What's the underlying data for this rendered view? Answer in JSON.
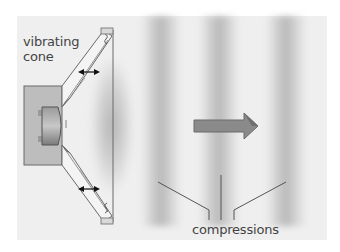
{
  "diagram": {
    "labels": {
      "cone": "vibrating\ncone",
      "cone_line1": "vibrating",
      "cone_line2": "cone",
      "compressions": "compressions"
    },
    "components": [
      "magnet-housing",
      "voice-coil",
      "vibrating-cone",
      "speaker-frame",
      "vibration-arrows",
      "propagation-arrow",
      "compression-bands",
      "leader-lines"
    ],
    "compression_band_count": 3,
    "propagation_direction": "right",
    "colors": {
      "background": "#ffffff",
      "panel": "#efefef",
      "housing": "#bdbdbd",
      "cone": "#f4f4f4",
      "outline": "#6a6a6a",
      "arrow_fill": "#8a8a8a",
      "band": "#8c8c8c",
      "text": "#444444"
    }
  }
}
